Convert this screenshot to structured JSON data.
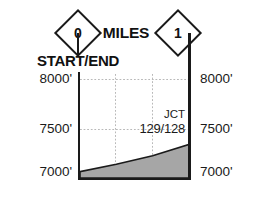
{
  "header": {
    "milepost_start": "0",
    "milepost_end": "1",
    "axis_title": "MILES",
    "start_end_label": "START/END"
  },
  "annotations": {
    "junction_label": "JCT",
    "junction_numbers": "129/128"
  },
  "axis": {
    "left_ticks": [
      "8000'",
      "7500'",
      "7000'"
    ],
    "right_ticks": [
      "8000'",
      "7500'",
      "7000'"
    ]
  },
  "colors": {
    "ink": "#1a1a1a",
    "fill": "#a6a6a6",
    "grid": "#b9b9b9",
    "background": "#ffffff"
  },
  "chart_data": {
    "type": "area",
    "title": "MILES",
    "subtitle": "START/END",
    "xlabel": "MILES",
    "ylabel": "Elevation (feet)",
    "xlim": [
      0,
      1
    ],
    "ylim": [
      7000,
      8000
    ],
    "x_tick_labels": [
      "0",
      "1"
    ],
    "y_tick_labels": [
      "7000'",
      "7500'",
      "8000'"
    ],
    "y_ticks": [
      7000,
      7500,
      8000
    ],
    "grid": true,
    "legend": "none",
    "series": [
      {
        "name": "Elevation profile",
        "x": [
          0.0,
          0.33,
          0.66,
          1.0
        ],
        "values": [
          7060,
          7130,
          7210,
          7320
        ]
      }
    ],
    "annotations": [
      {
        "text": "JCT 129/128",
        "x": 0.95,
        "y": 7500
      },
      {
        "text": "START/END",
        "x": 0.0,
        "y": 8000
      }
    ]
  }
}
